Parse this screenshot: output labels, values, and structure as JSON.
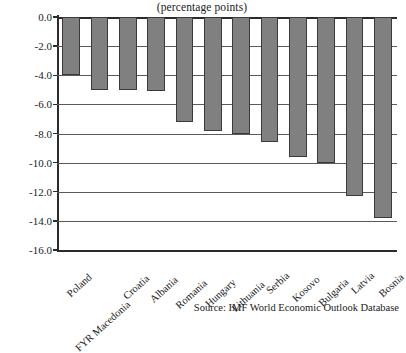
{
  "chart_data": {
    "type": "bar",
    "title": "(percentage points)",
    "xlabel": "",
    "ylabel": "",
    "ylim": [
      -16.0,
      0.0
    ],
    "y_ticks": [
      "0.0",
      "-2.0",
      "-4.0",
      "-6.0",
      "-8.0",
      "-10.0",
      "-12.0",
      "-14.0",
      "-16.0"
    ],
    "y_tick_values": [
      0.0,
      -2.0,
      -4.0,
      -6.0,
      -8.0,
      -10.0,
      -12.0,
      -14.0,
      -16.0
    ],
    "grid": true,
    "legend": "none",
    "orientation": "vertical",
    "bar_color": "#808080",
    "bar_edge_color": "#3a3a3a",
    "categories": [
      "Poland",
      "FYR Macedonia",
      "Croatia",
      "Albania",
      "Romania",
      "Hungary",
      "Lithuania",
      "Serbia",
      "Kosovo",
      "Bulgaria",
      "Latvia",
      "Bosnia"
    ],
    "values": [
      -4.0,
      -5.0,
      -5.0,
      -5.1,
      -7.2,
      -7.8,
      -8.0,
      -8.6,
      -9.6,
      -10.0,
      -12.3,
      -13.8
    ]
  },
  "caption": {
    "source": "Source: IMF World Economic Outlook Database"
  }
}
